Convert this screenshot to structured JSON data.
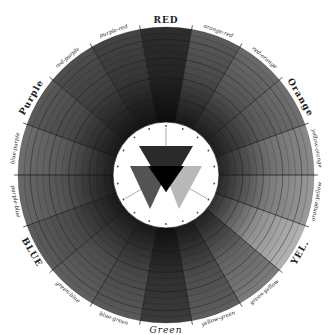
{
  "diagram": {
    "center": {
      "x": 166,
      "y": 175
    },
    "outer_radius": 148,
    "inner_radius": 53,
    "ring_count": 14,
    "segments": [
      {
        "label": "RED",
        "type": "major",
        "shade": "#2e2e2e"
      },
      {
        "label": "orange-red",
        "type": "minor",
        "shade": "#5a5a5a"
      },
      {
        "label": "red-orange",
        "type": "minor",
        "shade": "#6a6a6a"
      },
      {
        "label": "Orange",
        "type": "major",
        "shade": "#707070"
      },
      {
        "label": "yellow-orange",
        "type": "minor",
        "shade": "#8a8a8a"
      },
      {
        "label": "orange-yellow",
        "type": "minor",
        "shade": "#9a9a9a"
      },
      {
        "label": "YEL.",
        "type": "major",
        "shade": "#b4b4b4"
      },
      {
        "label": "green-yellow",
        "type": "minor",
        "shade": "#7c7c7c"
      },
      {
        "label": "yellow-green",
        "type": "minor",
        "shade": "#5e5e5e"
      },
      {
        "label": "Green",
        "type": "green",
        "shade": "#3c3c3c"
      },
      {
        "label": "blue-green",
        "type": "minor",
        "shade": "#5a5a5a"
      },
      {
        "label": "green-blue",
        "type": "minor",
        "shade": "#606060"
      },
      {
        "label": "BLUE",
        "type": "major",
        "shade": "#5c5c5c"
      },
      {
        "label": "purple-blue",
        "type": "minor",
        "shade": "#686868"
      },
      {
        "label": "blue-purple",
        "type": "minor",
        "shade": "#6e6e6e"
      },
      {
        "label": "Purple",
        "type": "major",
        "shade": "#5a5a5a"
      },
      {
        "label": "red-purple",
        "type": "minor",
        "shade": "#4e4e4e"
      },
      {
        "label": "purple-red",
        "type": "minor",
        "shade": "#444444"
      }
    ],
    "center_triangles": [
      {
        "name": "red-triangle",
        "fill": "#2a2a2a"
      },
      {
        "name": "blue-triangle",
        "fill": "#4a4a4a"
      },
      {
        "name": "yellow-triangle",
        "fill": "#b8b8b8"
      },
      {
        "name": "overlap",
        "fill": "#000000"
      }
    ]
  }
}
